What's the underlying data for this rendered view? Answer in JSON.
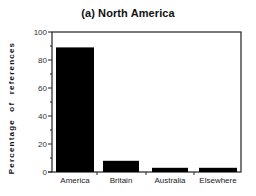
{
  "chart_data": {
    "type": "bar",
    "title": "(a) North America",
    "xlabel": "",
    "ylabel": "Percentage of references",
    "categories": [
      "America",
      "Britain",
      "Australia",
      "Elsewhere"
    ],
    "values": [
      89,
      8,
      3,
      3
    ],
    "ylim": [
      0,
      100
    ],
    "yticks": [
      0,
      20,
      40,
      60,
      80,
      100
    ],
    "grid": false,
    "legend": null,
    "bar_color": "#000000"
  },
  "layout": {
    "plot": {
      "left": 52,
      "right": 241,
      "top": 32,
      "bottom": 172
    },
    "bars_x": [
      [
        56,
        94
      ],
      [
        103,
        139
      ],
      [
        152,
        188
      ],
      [
        199,
        237
      ]
    ],
    "xticks_px": [
      97,
      146,
      194
    ]
  }
}
